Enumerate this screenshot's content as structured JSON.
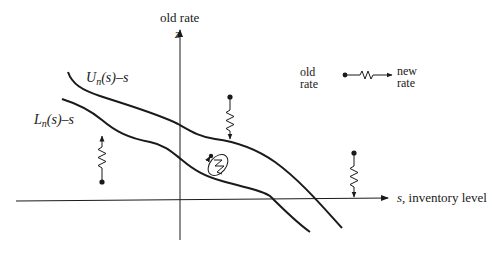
{
  "diagram": {
    "z_axis": {
      "symbol": "z",
      "label": "old rate"
    },
    "s_axis": {
      "symbol": "s",
      "label": ", inventory level"
    },
    "curves": [
      {
        "id": "upper",
        "label_base": "U",
        "label_sub": "n",
        "label_tail": "(s)–s"
      },
      {
        "id": "lower",
        "label_base": "L",
        "label_sub": "n",
        "label_tail": "(s)–s"
      }
    ],
    "legend": {
      "from_line1": "old",
      "from_line2": "rate",
      "to_line1": "new",
      "to_line2": "rate"
    },
    "colors": {
      "ink": "#1a1a1a",
      "background": "#ffffff"
    }
  }
}
